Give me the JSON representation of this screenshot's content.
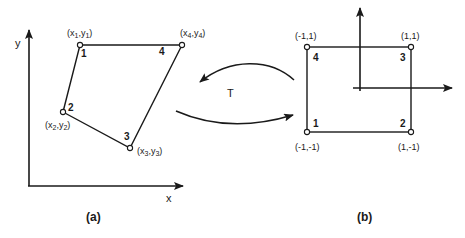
{
  "figure": {
    "stroke_color": "#1a1a1a",
    "background": "#ffffff",
    "panel_a": {
      "caption": "(a)",
      "axes": {
        "x_label": "x",
        "y_label": "y"
      },
      "nodes": [
        {
          "id": "1",
          "number": "1",
          "coord_label": "(x1,y1)",
          "sub": "1"
        },
        {
          "id": "2",
          "number": "2",
          "coord_label": "(x2,y2)",
          "sub": "2"
        },
        {
          "id": "3",
          "number": "3",
          "coord_label": "(x3,y3)",
          "sub": "3"
        },
        {
          "id": "4",
          "number": "4",
          "coord_label": "(x4,y4)",
          "sub": "4"
        }
      ]
    },
    "transform": {
      "label": "T"
    },
    "panel_b": {
      "caption": "(b)",
      "nodes": [
        {
          "id": "1",
          "number": "1",
          "coord_label": "(-1,-1)"
        },
        {
          "id": "2",
          "number": "2",
          "coord_label": "(1,-1)"
        },
        {
          "id": "3",
          "number": "3",
          "coord_label": "(1,1)"
        },
        {
          "id": "4",
          "number": "4",
          "coord_label": "(-1,1)"
        }
      ]
    }
  }
}
